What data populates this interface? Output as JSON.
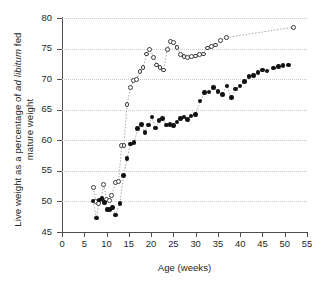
{
  "chart_data": {
    "type": "scatter",
    "title": "",
    "xlabel": "Age (weeks)",
    "ylabel_line1": "Live weight as a percentage of ",
    "ylabel_italic": "ad libitum",
    "ylabel_line1b": " fed",
    "ylabel_line2": "mature weight",
    "xlim": [
      0,
      55
    ],
    "ylim": [
      45,
      80
    ],
    "xticks": [
      0,
      5,
      10,
      15,
      20,
      25,
      30,
      35,
      40,
      45,
      50,
      55
    ],
    "yticks": [
      45,
      50,
      55,
      60,
      65,
      70,
      75,
      80
    ],
    "grid": "horizontal-dotted",
    "legend": "none",
    "connector": "dotted",
    "series": [
      {
        "name": "open-circles",
        "marker": "open-circle",
        "color": "#3a3a3a",
        "points": [
          [
            7.0,
            52.3
          ],
          [
            7.6,
            50.0
          ],
          [
            8.2,
            49.6
          ],
          [
            8.8,
            50.4
          ],
          [
            9.4,
            52.8
          ],
          [
            10.0,
            50.3
          ],
          [
            10.6,
            50.1
          ],
          [
            11.2,
            51.0
          ],
          [
            12.0,
            53.1
          ],
          [
            12.7,
            53.3
          ],
          [
            13.4,
            59.1
          ],
          [
            13.9,
            59.2
          ],
          [
            14.6,
            65.8
          ],
          [
            15.4,
            68.6
          ],
          [
            16.1,
            69.8
          ],
          [
            16.8,
            70.0
          ],
          [
            17.5,
            71.2
          ],
          [
            18.2,
            71.9
          ],
          [
            19.0,
            74.1
          ],
          [
            19.7,
            74.9
          ],
          [
            20.6,
            73.6
          ],
          [
            21.3,
            72.3
          ],
          [
            22.0,
            71.9
          ],
          [
            22.8,
            71.5
          ],
          [
            23.6,
            74.8
          ],
          [
            24.3,
            76.2
          ],
          [
            25.0,
            76.0
          ],
          [
            25.8,
            75.2
          ],
          [
            26.6,
            74.0
          ],
          [
            27.4,
            73.7
          ],
          [
            28.2,
            73.6
          ],
          [
            29.0,
            73.7
          ],
          [
            29.9,
            73.8
          ],
          [
            30.8,
            74.0
          ],
          [
            31.7,
            74.1
          ],
          [
            32.6,
            75.1
          ],
          [
            33.5,
            75.4
          ],
          [
            34.4,
            75.6
          ],
          [
            35.6,
            76.3
          ],
          [
            37.0,
            76.8
          ],
          [
            52.0,
            78.5
          ]
        ]
      },
      {
        "name": "filled-circles",
        "marker": "filled-circle",
        "color": "#111111",
        "points": [
          [
            7.0,
            50.1
          ],
          [
            7.7,
            47.3
          ],
          [
            8.4,
            50.2
          ],
          [
            9.0,
            50.5
          ],
          [
            9.6,
            49.8
          ],
          [
            10.2,
            48.7
          ],
          [
            10.8,
            48.7
          ],
          [
            11.4,
            49.0
          ],
          [
            12.0,
            47.8
          ],
          [
            13.0,
            49.7
          ],
          [
            13.8,
            54.2
          ],
          [
            14.6,
            57.0
          ],
          [
            15.4,
            59.4
          ],
          [
            16.2,
            59.6
          ],
          [
            17.0,
            61.9
          ],
          [
            17.8,
            62.6
          ],
          [
            18.6,
            61.3
          ],
          [
            19.4,
            62.5
          ],
          [
            20.2,
            63.8
          ],
          [
            21.0,
            62.0
          ],
          [
            21.8,
            63.2
          ],
          [
            22.6,
            63.6
          ],
          [
            23.4,
            62.5
          ],
          [
            24.2,
            62.6
          ],
          [
            25.0,
            62.4
          ],
          [
            25.8,
            63.0
          ],
          [
            26.6,
            63.6
          ],
          [
            27.4,
            63.8
          ],
          [
            28.2,
            63.4
          ],
          [
            29.0,
            64.0
          ],
          [
            30.0,
            64.2
          ],
          [
            31.0,
            66.4
          ],
          [
            32.0,
            67.8
          ],
          [
            33.0,
            67.9
          ],
          [
            34.0,
            68.6
          ],
          [
            35.0,
            68.0
          ],
          [
            36.0,
            67.5
          ],
          [
            37.0,
            68.9
          ],
          [
            38.0,
            67.0
          ],
          [
            39.0,
            68.4
          ],
          [
            40.0,
            68.9
          ],
          [
            41.0,
            69.6
          ],
          [
            42.0,
            70.4
          ],
          [
            43.0,
            70.6
          ],
          [
            44.0,
            71.1
          ],
          [
            45.0,
            71.5
          ],
          [
            46.0,
            71.3
          ],
          [
            47.5,
            71.8
          ],
          [
            48.6,
            72.1
          ],
          [
            49.6,
            72.2
          ],
          [
            50.8,
            72.3
          ]
        ]
      }
    ]
  }
}
